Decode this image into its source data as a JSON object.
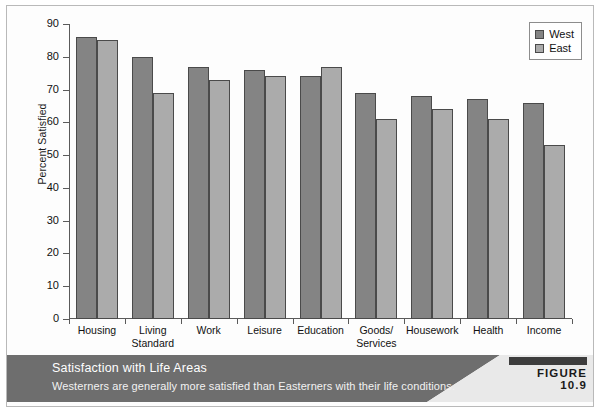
{
  "figure": {
    "caption_title": "Satisfaction with Life Areas",
    "caption_subtitle": "Westerners are generally more satisfied than Easterners with their life conditions.",
    "badge_label": "FIGURE 10.9"
  },
  "colors": {
    "west_bar": "#848484",
    "east_bar": "#ababab",
    "bar_outline": "#4a4a4a",
    "band": "#6e6e6e",
    "band_right": "#e9e9e9",
    "axis": "#5a5a5a"
  },
  "chart_data": {
    "type": "bar",
    "title": "",
    "xlabel": "",
    "ylabel": "Percent Satisfied",
    "ylim": [
      0,
      90
    ],
    "yticks": [
      0,
      10,
      20,
      30,
      40,
      50,
      60,
      70,
      80,
      90
    ],
    "ytick_labels": [
      "0",
      "10",
      "20",
      "30",
      "40",
      "50",
      "60",
      "70",
      "80",
      "90"
    ],
    "grid": false,
    "legend_position": "top-right",
    "categories": [
      "Housing",
      "Living Standard",
      "Work",
      "Leisure",
      "Education",
      "Goods/ Services",
      "Housework",
      "Health",
      "Income"
    ],
    "category_lines": [
      [
        "Housing"
      ],
      [
        "Living",
        "Standard"
      ],
      [
        "Work"
      ],
      [
        "Leisure"
      ],
      [
        "Education"
      ],
      [
        "Goods/",
        "Services"
      ],
      [
        "Housework"
      ],
      [
        "Health"
      ],
      [
        "Income"
      ]
    ],
    "series": [
      {
        "name": "West",
        "values": [
          86,
          80,
          77,
          76,
          74,
          69,
          68,
          67,
          66
        ]
      },
      {
        "name": "East",
        "values": [
          85,
          69,
          73,
          74,
          77,
          61,
          64,
          61,
          53
        ]
      }
    ]
  }
}
